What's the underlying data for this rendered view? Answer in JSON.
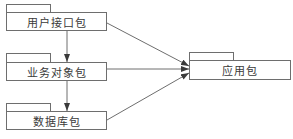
{
  "diagram": {
    "type": "uml-package-dependency",
    "line_color": "#6e6e6e",
    "packages": [
      {
        "id": "ui",
        "label": "用户接口包",
        "tab": {
          "x": 6,
          "y": 4,
          "w": 45,
          "h": 9
        },
        "body": {
          "x": 6,
          "y": 12,
          "w": 101,
          "h": 19
        }
      },
      {
        "id": "business",
        "label": "业务对象包",
        "tab": {
          "x": 6,
          "y": 53,
          "w": 45,
          "h": 10
        },
        "body": {
          "x": 6,
          "y": 62,
          "w": 101,
          "h": 19
        }
      },
      {
        "id": "database",
        "label": "数据库包",
        "tab": {
          "x": 6,
          "y": 103,
          "w": 45,
          "h": 9
        },
        "body": {
          "x": 6,
          "y": 111,
          "w": 101,
          "h": 19
        }
      },
      {
        "id": "application",
        "label": "应用包",
        "tab": {
          "x": 189,
          "y": 52,
          "w": 45,
          "h": 9
        },
        "body": {
          "x": 189,
          "y": 60,
          "w": 102,
          "h": 20
        }
      }
    ],
    "dependencies": [
      {
        "from": "用户接口包",
        "to": "业务对象包"
      },
      {
        "from": "业务对象包",
        "to": "数据库包"
      },
      {
        "from": "用户接口包",
        "to": "应用包"
      },
      {
        "from": "业务对象包",
        "to": "应用包"
      },
      {
        "from": "数据库包",
        "to": "应用包"
      }
    ]
  }
}
